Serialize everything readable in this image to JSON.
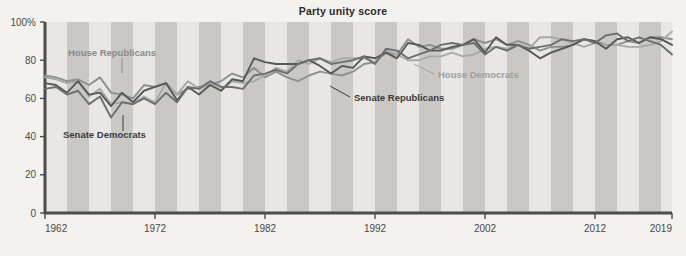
{
  "chart_data": {
    "type": "line",
    "title": "Party unity score",
    "xlabel": "",
    "ylabel": "",
    "xlim": [
      1962,
      2019
    ],
    "ylim": [
      0,
      100
    ],
    "grid": false,
    "legend_position": "inline-annotations",
    "y_ticks": [
      "0",
      "20",
      "40",
      "60",
      "80",
      "100%"
    ],
    "y_tick_values": [
      0,
      20,
      40,
      60,
      80,
      100
    ],
    "x_ticks": [
      "1962",
      "1972",
      "1982",
      "1992",
      "2002",
      "2012",
      "2019"
    ],
    "x_tick_values": [
      1962,
      1972,
      1982,
      1992,
      2002,
      2012,
      2019
    ],
    "background_bands": {
      "note": "alternating shaded vertical bands, one per two-year congress",
      "light": "#e8e7e3",
      "dark": "#c9c8c4",
      "period_years": 4,
      "start_year": 1962
    },
    "x": [
      1962,
      1963,
      1964,
      1965,
      1966,
      1967,
      1968,
      1969,
      1970,
      1971,
      1972,
      1973,
      1974,
      1975,
      1976,
      1977,
      1978,
      1979,
      1980,
      1981,
      1982,
      1983,
      1984,
      1985,
      1986,
      1987,
      1988,
      1989,
      1990,
      1991,
      1992,
      1993,
      1994,
      1995,
      1996,
      1997,
      1998,
      1999,
      2000,
      2001,
      2002,
      2003,
      2004,
      2005,
      2006,
      2007,
      2008,
      2009,
      2010,
      2011,
      2012,
      2013,
      2014,
      2015,
      2016,
      2017,
      2018,
      2019
    ],
    "series": [
      {
        "name": "House Republicans",
        "color": "#8f8f8f",
        "values": [
          72,
          71,
          69,
          70,
          67,
          71,
          63,
          62,
          60,
          67,
          66,
          68,
          62,
          65,
          66,
          67,
          69,
          73,
          71,
          76,
          71,
          74,
          71,
          69,
          72,
          74,
          73,
          72,
          74,
          78,
          79,
          84,
          83,
          91,
          87,
          88,
          86,
          86,
          88,
          91,
          89,
          91,
          88,
          90,
          88,
          85,
          87,
          87,
          88,
          91,
          90,
          88,
          88,
          90,
          89,
          92,
          92,
          91
        ]
      },
      {
        "name": "House Democrats",
        "color": "#a9a9a9",
        "values": [
          71,
          70,
          68,
          69,
          61,
          65,
          57,
          58,
          57,
          61,
          58,
          68,
          62,
          69,
          65,
          68,
          64,
          69,
          68,
          69,
          72,
          76,
          74,
          80,
          78,
          81,
          79,
          81,
          81,
          81,
          79,
          85,
          83,
          80,
          80,
          82,
          82,
          84,
          82,
          83,
          86,
          87,
          86,
          88,
          86,
          92,
          92,
          91,
          89,
          87,
          89,
          88,
          88,
          87,
          87,
          88,
          90,
          95
        ]
      },
      {
        "name": "Senate Republicans",
        "color": "#585858",
        "values": [
          68,
          67,
          63,
          69,
          62,
          63,
          56,
          63,
          58,
          64,
          66,
          68,
          59,
          66,
          62,
          67,
          64,
          70,
          69,
          81,
          79,
          78,
          78,
          78,
          80,
          77,
          73,
          77,
          76,
          82,
          81,
          84,
          81,
          89,
          88,
          85,
          85,
          87,
          88,
          91,
          84,
          92,
          88,
          88,
          85,
          81,
          84,
          86,
          88,
          91,
          90,
          86,
          91,
          92,
          89,
          92,
          91,
          88
        ]
      },
      {
        "name": "Senate Democrats",
        "color": "#6e6e6e",
        "values": [
          65,
          66,
          62,
          64,
          57,
          61,
          50,
          58,
          57,
          60,
          57,
          63,
          58,
          66,
          65,
          69,
          66,
          66,
          65,
          72,
          73,
          75,
          73,
          78,
          80,
          81,
          78,
          79,
          80,
          82,
          78,
          86,
          85,
          81,
          83,
          85,
          88,
          89,
          88,
          89,
          83,
          87,
          85,
          88,
          86,
          87,
          88,
          91,
          90,
          91,
          89,
          93,
          94,
          90,
          92,
          90,
          88,
          83
        ]
      }
    ],
    "annotations": [
      {
        "text": "House Republicans",
        "series": "House Republicans",
        "label_x": 68,
        "label_y": 56,
        "anchor": "start",
        "color": "#8a8a8a",
        "leader_from_x": 122,
        "leader_from_y": 58,
        "leader_to_x": 122,
        "leader_to_y": 73
      },
      {
        "text": "Senate Democrats",
        "series": "Senate Democrats",
        "label_x": 63,
        "label_y": 138,
        "anchor": "start",
        "color": "#3b3b3b",
        "leader_from_x": 123,
        "leader_from_y": 131,
        "leader_to_x": 123,
        "leader_to_y": 115
      },
      {
        "text": "House Democrats",
        "series": "House Democrats",
        "label_x": 438,
        "label_y": 78,
        "anchor": "start",
        "color": "#a0a0a0",
        "leader_from_x": 434,
        "leader_from_y": 74,
        "leader_to_x": 414,
        "leader_to_y": 64
      },
      {
        "text": "Senate Republicans",
        "series": "Senate Republicans",
        "label_x": 354,
        "label_y": 101,
        "anchor": "start",
        "color": "#3b3b3b",
        "leader_from_x": 350,
        "leader_from_y": 97,
        "leader_to_x": 330,
        "leader_to_y": 86
      }
    ],
    "axis_color": "#4d4d4d"
  }
}
